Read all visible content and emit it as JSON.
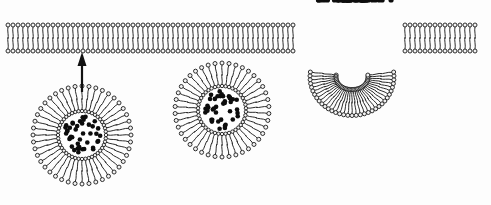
{
  "diagram": {
    "title": "Exocytosis: vesicle fusion with plasma membrane",
    "background_color": "#fdfdfd",
    "width": 491,
    "height": 205,
    "colors": {
      "head_fill": "#f2f2f2",
      "head_stroke": "#1a1a1a",
      "tail_stroke": "#2b2b2b",
      "cargo_fill": "#0d0d0d",
      "arrow_fill": "#111111"
    },
    "membrane": {
      "label": "plasma-membrane-bilayer",
      "left_x": 8,
      "right_x": 478,
      "top_y": 25,
      "bottom_y": 51,
      "thickness": 26,
      "head_radius": 2.0,
      "lipid_spacing": 5.0,
      "flat_left_end": 296,
      "flat_right_start": 404,
      "pore": {
        "label": "fusion-pore-invagination",
        "center_x": 352,
        "mouth_left_x": 296,
        "mouth_right_x": 404,
        "depth_y": 100,
        "bowl_radius": 42
      }
    },
    "vesicles": [
      {
        "label": "vesicle-docking",
        "cx": 82,
        "cy": 135,
        "lumen_radius": 24,
        "outer_radius": 49,
        "lipid_count": 44,
        "cargo_count": 42
      },
      {
        "label": "vesicle-approaching",
        "cx": 222,
        "cy": 110,
        "lumen_radius": 24,
        "outer_radius": 47,
        "lipid_count": 42,
        "cargo_count": 40
      }
    ],
    "arrow": {
      "label": "vesicle-transport-arrow",
      "x": 82,
      "y_tail": 92,
      "y_head": 52,
      "head_width": 9,
      "head_length": 14
    },
    "released_cargo": {
      "label": "released-cargo-particles",
      "count": 46,
      "dot_radius": 2.6,
      "region": {
        "x_min": 310,
        "x_max": 400,
        "y_min": 6,
        "y_max": 96
      }
    }
  }
}
